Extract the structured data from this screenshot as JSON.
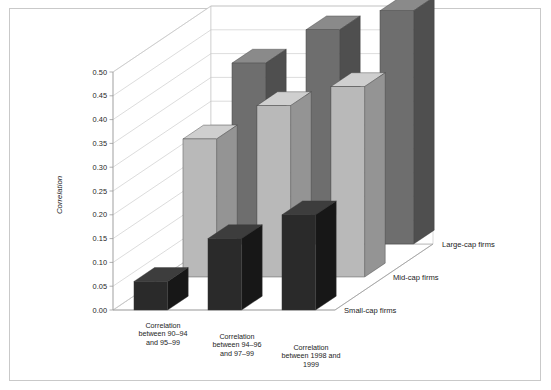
{
  "figure": {
    "background_color": "#ffffff",
    "frame_color": "#c9c9c9"
  },
  "chart_data": {
    "type": "bar",
    "title": "",
    "subtitle": "",
    "xlabel": "",
    "ylabel": "Correlation",
    "zlabel": "",
    "ylim": [
      0.0,
      0.5
    ],
    "ytick_step": 0.05,
    "grid": true,
    "legend_position": "right-depth-axis",
    "projection": "3d",
    "categories": [
      "Correlation between 90–94 and 95–99",
      "Correlation between 94–96 and 97–99",
      "Correlation between 1998 and 1999"
    ],
    "category_lines": [
      [
        "Correlation",
        "between 90–94",
        "and 95–99"
      ],
      [
        "Correlation",
        "between 94–96",
        "and 97–99"
      ],
      [
        "Correlation",
        "between 1998 and",
        "1999"
      ]
    ],
    "ytick_labels": [
      "0.00",
      "0.05",
      "0.10",
      "0.15",
      "0.20",
      "0.25",
      "0.30",
      "0.35",
      "0.40",
      "0.45",
      "0.50"
    ],
    "ytick_values": [
      0.0,
      0.05,
      0.1,
      0.15,
      0.2,
      0.25,
      0.3,
      0.35,
      0.4,
      0.45,
      0.5
    ],
    "series": [
      {
        "name": "Large-cap firms",
        "color": "#6e6e6e",
        "side_color": "#4f4f4f",
        "top_color": "#8a8a8a",
        "values": [
          0.38,
          0.45,
          0.49
        ]
      },
      {
        "name": "Mid-cap firms",
        "color": "#b9b9b9",
        "side_color": "#949494",
        "top_color": "#cfcfcf",
        "values": [
          0.29,
          0.36,
          0.4
        ]
      },
      {
        "name": "Small-cap firms",
        "color": "#2a2a2a",
        "side_color": "#171717",
        "top_color": "#3d3d3d",
        "values": [
          0.06,
          0.15,
          0.2
        ]
      }
    ]
  }
}
